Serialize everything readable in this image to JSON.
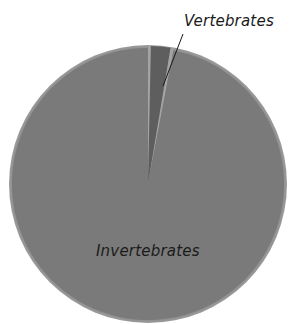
{
  "chart_data": {
    "type": "pie",
    "title": "",
    "categories": [
      "Vertebrates",
      "Invertebrates"
    ],
    "values": [
      3,
      97
    ],
    "unit": "%",
    "start_angle_deg": 0,
    "direction": "clockwise",
    "colors": {
      "Vertebrates": "#5e5e5e",
      "Invertebrates": "#7a7a7a",
      "separator": "#a4a4a4",
      "rim": "#9a9a9a"
    },
    "labels": {
      "vertebrates": "Vertebrates",
      "invertebrates": "Invertebrates"
    },
    "annotations": [
      {
        "text": "Vertebrates",
        "type": "leader-line label",
        "position": "above-right"
      },
      {
        "text": "Invertebrates",
        "type": "inside label",
        "position": "lower-center"
      }
    ],
    "legend": "none",
    "geometry": {
      "cx": 148,
      "cy": 184,
      "r": 139
    }
  }
}
